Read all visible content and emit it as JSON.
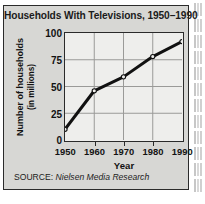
{
  "card": {
    "source_prefix": "SOURCE:",
    "source_name": "Nielsen Media Research"
  },
  "chart_data": {
    "type": "line",
    "title": "Households With Televisions, 1950–1990",
    "xlabel": "Year",
    "ylabel_line1": "Number of households",
    "ylabel_line2": "(in millions)",
    "x": [
      1950,
      1960,
      1970,
      1980,
      1990
    ],
    "categories": [
      "1950",
      "1960",
      "1970",
      "1980",
      "1990"
    ],
    "values": [
      10,
      46,
      59,
      78,
      92
    ],
    "xtick_labels": [
      "1950",
      "1960",
      "1970",
      "1980",
      "1990"
    ],
    "ytick_labels": [
      "0",
      "25",
      "50",
      "75",
      "100"
    ],
    "yticks": [
      0,
      25,
      50,
      75,
      100
    ],
    "xlim": [
      1950,
      1990
    ],
    "ylim": [
      0,
      100
    ],
    "grid": true,
    "legend": "none",
    "marker": "open-circle",
    "line_color": "#111111",
    "grid_color": "#9a9a98",
    "plot_bg": "#eeeeec",
    "card_bg": "#d7d7d4",
    "border_color": "#2b2b2b"
  }
}
